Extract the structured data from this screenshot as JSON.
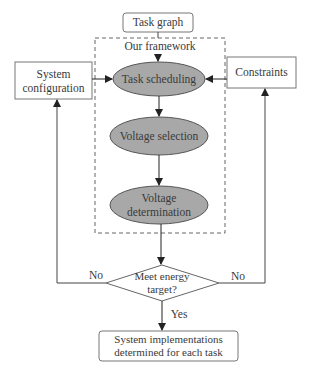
{
  "diagram": {
    "task_graph": "Task graph",
    "framework_label": "Our framework",
    "system_configuration": [
      "System",
      "configuration"
    ],
    "constraints": "Constraints",
    "task_scheduling": "Task scheduling",
    "voltage_selection": "Voltage selection",
    "voltage_determination": [
      "Voltage",
      "determination"
    ],
    "decision": [
      "Meet energy",
      "target?"
    ],
    "no_left": "No",
    "no_right": "No",
    "yes": "Yes",
    "result": [
      "System implementations",
      "determined for each task"
    ],
    "colors": {
      "ellipse_fill": "#a8a8a8",
      "stroke": "#555555"
    }
  }
}
